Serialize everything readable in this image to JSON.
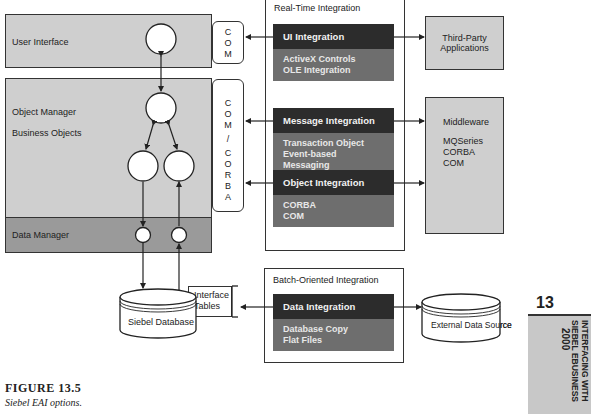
{
  "left_stack": {
    "user_interface": "User Interface",
    "object_manager": "Object Manager",
    "business_objects": "Business Objects",
    "data_manager": "Data Manager"
  },
  "connectors": {
    "com": [
      "C",
      "O",
      "M"
    ],
    "com_corba": [
      "C",
      "O",
      "M",
      "/",
      "C",
      "O",
      "R",
      "B",
      "A"
    ]
  },
  "real_time": {
    "title": "Real-Time Integration",
    "blocks": [
      {
        "header": "UI Integration",
        "items": [
          "ActiveX Controls",
          "OLE Integration"
        ]
      },
      {
        "header": "Message Integration",
        "items": [
          "Transaction Object",
          "Event-based Messaging"
        ]
      },
      {
        "header": "Object Integration",
        "items": [
          "CORBA",
          "COM"
        ]
      }
    ]
  },
  "batch": {
    "title": "Batch-Oriented Integration",
    "blocks": [
      {
        "header": "Data Integration",
        "items": [
          "Database Copy",
          "Flat Files"
        ]
      }
    ]
  },
  "external": {
    "third_party": [
      "Third-Party",
      "Applications"
    ],
    "middleware_title": "Middleware",
    "middleware_items": [
      "MQSeries",
      "CORBA",
      "COM"
    ],
    "external_data_source": "External Data Source"
  },
  "database": {
    "siebel_database": "Siebel Database",
    "interface_tables": [
      "Interface",
      "Tables"
    ]
  },
  "chapter_tab": {
    "number": "13",
    "lines": [
      "INTERFACING WITH",
      "SIEBEL EBUSINESS",
      "2000"
    ]
  },
  "caption": {
    "title": "FIGURE 13.5",
    "subtitle": "Siebel EAI options."
  }
}
